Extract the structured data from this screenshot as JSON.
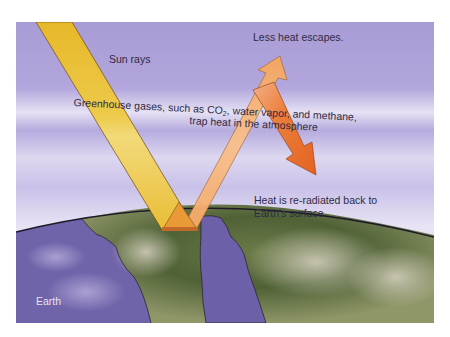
{
  "diagram": {
    "labels": {
      "sun_rays": "Sun rays",
      "less_heat": "Less heat escapes.",
      "greenhouse_line1_pre": "Greenhouse gases, such as CO",
      "greenhouse_line1_sub": "2",
      "greenhouse_line1_post": ", water vapor, and methane,",
      "greenhouse_line2": "trap heat in the atmosphere",
      "reradiated_line1": "Heat is re-radiated back to",
      "reradiated_line2": "Earth's surface",
      "earth": "Earth"
    },
    "colors": {
      "sky_top": "#a79ad6",
      "sky_haze": "#ece8f6",
      "sun_ray": "#e8bb2e",
      "escaping_heat": "#f6a862",
      "reradiated_heat": "#e8702a",
      "ocean": "#6e62a8",
      "land_green": "#55683a",
      "land_tan": "#c8b98a"
    }
  }
}
